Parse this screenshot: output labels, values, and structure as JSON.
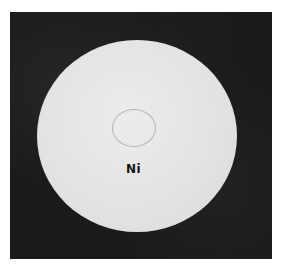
{
  "photo": {
    "subject": "metal-disc",
    "label": "Ni",
    "colors": {
      "background": "#1a1a1a",
      "disc": "#e4e4e2",
      "label": "#111111"
    }
  }
}
